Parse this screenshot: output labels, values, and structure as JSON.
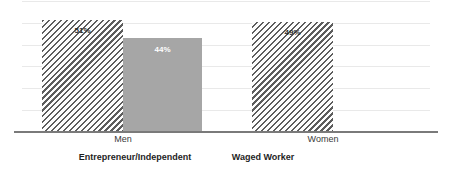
{
  "chart_data": {
    "type": "bar",
    "title": "",
    "subtitle": "",
    "xlabel": "",
    "ylabel": "",
    "ylim": [
      0,
      60
    ],
    "grid": true,
    "grid_lines": 6,
    "legend_position": "below-axis",
    "categories": [
      "Men",
      "Women"
    ],
    "series": [
      {
        "name": "Entrepreneur/Independent",
        "style": "hatch",
        "values": [
          51,
          49
        ],
        "value_labels": [
          "51%",
          "49%"
        ]
      },
      {
        "name": "Waged Worker",
        "style": "solid",
        "values": [
          44,
          null
        ],
        "value_labels": [
          "44%",
          ""
        ]
      }
    ],
    "bars": [
      {
        "id": "men-entrepreneur",
        "category": "Men",
        "series": "Entrepreneur/Independent",
        "value": 51,
        "label": "51%",
        "style": "hatch",
        "left": 42,
        "width": 81,
        "height": 112
      },
      {
        "id": "men-waged",
        "category": "Men",
        "series": "Waged Worker",
        "value": 44,
        "label": "44%",
        "style": "solid",
        "left": 123,
        "width": 79,
        "height": 94
      },
      {
        "id": "women-entrepreneur",
        "category": "Women",
        "series": "Entrepreneur/Independent",
        "value": 49,
        "label": "49%",
        "style": "hatch",
        "left": 252,
        "width": 81,
        "height": 110
      }
    ]
  },
  "axis": {
    "categories": [
      {
        "label": "Men",
        "left": 92,
        "width": 62
      },
      {
        "label": "Women",
        "left": 292,
        "width": 62
      }
    ]
  },
  "legend": {
    "items": [
      {
        "label": "Entrepreneur/Independent",
        "left": 55,
        "width": 160
      },
      {
        "label": "Waged Worker",
        "left": 218,
        "width": 90
      }
    ]
  },
  "colors": {
    "hatch_stroke": "#5d5d5d",
    "solid_fill": "#a6a6a6",
    "axis_line": "#7a7a7a",
    "gridline": "#e9e9e9",
    "label_dark": "#2b2b2b",
    "label_light": "#ffffff",
    "category_text": "#3a3a3a",
    "legend_text": "#1e1e1e",
    "background": "#ffffff"
  }
}
